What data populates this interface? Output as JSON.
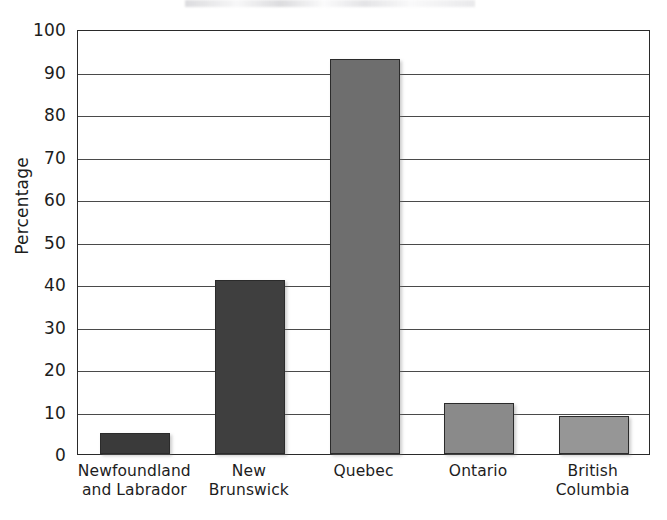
{
  "chart_data": {
    "type": "bar",
    "title": "",
    "xlabel": "",
    "ylabel": "Percentage",
    "categories": [
      "Newfoundland and Labrador",
      "New Brunswick",
      "Quebec",
      "Ontario",
      "British Columbia"
    ],
    "category_lines": [
      [
        "Newfoundland",
        "and Labrador"
      ],
      [
        "New",
        "Brunswick"
      ],
      [
        "Quebec"
      ],
      [
        "Ontario"
      ],
      [
        "British",
        "Columbia"
      ]
    ],
    "values": [
      5,
      41,
      93,
      12,
      9
    ],
    "bar_colors": [
      "#3a3a3a",
      "#3f3f3f",
      "#6e6e6e",
      "#8a8a8a",
      "#969696"
    ],
    "ylim": [
      0,
      100
    ],
    "ytick_step": 10,
    "yticks": [
      100,
      90,
      80,
      70,
      60,
      50,
      40,
      30,
      20,
      10,
      0
    ],
    "grid": true,
    "legend": "none",
    "axis_color": "#2a2a2a",
    "gridline_color": "#4a4a4a"
  }
}
